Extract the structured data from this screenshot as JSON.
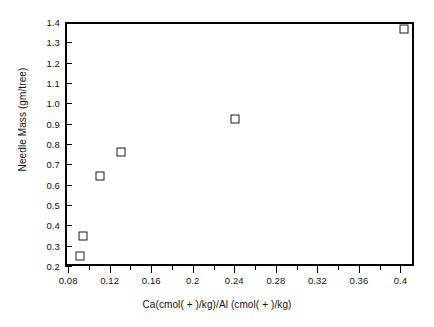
{
  "chart_data": {
    "type": "scatter",
    "title": "",
    "xlabel": "Ca(cmol( + )/kg)/Al  (cmol( + )/kg)",
    "ylabel": "Needle Mass (gm/tree)",
    "xlim": [
      0.077,
      0.413
    ],
    "ylim": [
      0.2,
      1.4
    ],
    "grid": false,
    "legend": "none",
    "marker": "open-square",
    "xticks": [
      0.08,
      0.12,
      0.16,
      0.2,
      0.24,
      0.28,
      0.32,
      0.36,
      0.4
    ],
    "xtick_labels": [
      "0.08",
      "0.12",
      "0.16",
      "0.2",
      "0.24",
      "0.28",
      "0.32",
      "0.36",
      "0.4"
    ],
    "xminor_step": 0.02,
    "yticks": [
      0.2,
      0.3,
      0.4,
      0.5,
      0.6,
      0.7,
      0.8,
      0.9,
      1.0,
      1.1,
      1.2,
      1.3,
      1.4
    ],
    "ytick_labels": [
      "0.2",
      "0.3",
      "0.4",
      "0.5",
      "0.6",
      "0.7",
      "0.8",
      "0.9",
      "1.0",
      "1.1",
      "1.2",
      "1.3",
      "1.4"
    ],
    "x": [
      0.091,
      0.094,
      0.111,
      0.131,
      0.241,
      0.403
    ],
    "y": [
      0.25,
      0.35,
      0.645,
      0.76,
      0.925,
      1.365
    ],
    "points": [
      {
        "x": 0.091,
        "y": 0.25
      },
      {
        "x": 0.094,
        "y": 0.35
      },
      {
        "x": 0.111,
        "y": 0.645
      },
      {
        "x": 0.131,
        "y": 0.76
      },
      {
        "x": 0.241,
        "y": 0.925
      },
      {
        "x": 0.403,
        "y": 1.365
      }
    ],
    "colors": {
      "marker_edge": "#1a1a1a",
      "marker_face": "#ffffff",
      "axis": "#000000",
      "text": "#111111",
      "background": "#ffffff"
    }
  }
}
